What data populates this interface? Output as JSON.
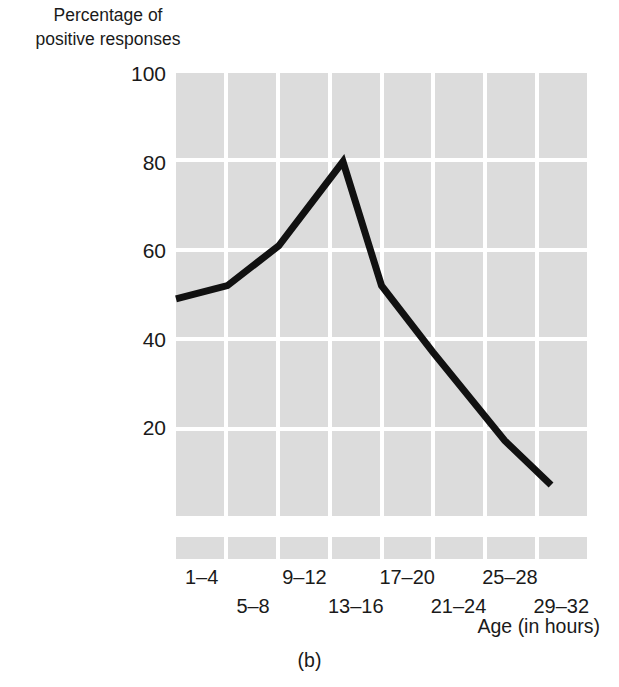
{
  "figure": {
    "caption": "(b)",
    "y_axis_title": "Percentage of\npositive responses",
    "x_axis_title": "Age (in hours)"
  },
  "chart_data": {
    "type": "line",
    "title": "",
    "subtitle": "",
    "xlabel": "Age (in hours)",
    "ylabel": "Percentage of positive responses",
    "categories": [
      "1–4",
      "5–8",
      "9–12",
      "13–16",
      "17–20",
      "21–24",
      "25–28",
      "29–32"
    ],
    "values": [
      49,
      52,
      61,
      80,
      52,
      37,
      17,
      7
    ],
    "series": [
      {
        "name": "Percentage of positive responses",
        "values": [
          49,
          52,
          61,
          80,
          52,
          37,
          17,
          7
        ]
      }
    ],
    "ylim": [
      0,
      100
    ],
    "ytick_labels": [
      "100",
      "80",
      "60",
      "40",
      "20"
    ],
    "ytick_values": [
      100,
      80,
      60,
      40,
      20
    ],
    "grid": true,
    "grid_style": "shaded-blocks",
    "legend": "none",
    "line_color": "#111111",
    "grid_color": "#dcdcdc",
    "background_color": "#ffffff"
  },
  "y_ticks": [
    {
      "label": "100",
      "value": 100
    },
    {
      "label": "80",
      "value": 80
    },
    {
      "label": "60",
      "value": 60
    },
    {
      "label": "40",
      "value": 40
    },
    {
      "label": "20",
      "value": 20
    }
  ],
  "x_ticks": [
    {
      "label": "1–4",
      "row": "top"
    },
    {
      "label": "5–8",
      "row": "bottom"
    },
    {
      "label": "9–12",
      "row": "top"
    },
    {
      "label": "13–16",
      "row": "bottom"
    },
    {
      "label": "17–20",
      "row": "top"
    },
    {
      "label": "21–24",
      "row": "bottom"
    },
    {
      "label": "25–28",
      "row": "top"
    },
    {
      "label": "29–32",
      "row": "bottom"
    }
  ]
}
